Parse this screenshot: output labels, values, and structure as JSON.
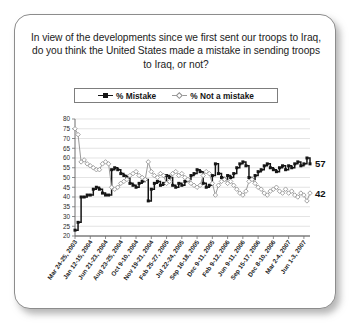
{
  "card": {
    "question": "In view of the developments since we first sent our troops to Iraq, do you think the United States made a mistake in sending troops to Iraq, or not?"
  },
  "legend": {
    "position": "top-center",
    "items": [
      {
        "label": "% Mistake",
        "marker": "filled-square",
        "color": "#151515"
      },
      {
        "label": "% Not a mistake",
        "marker": "open-diamond",
        "color": "#9a9a9a"
      }
    ]
  },
  "end_labels": {
    "mistake": "57",
    "not_a_mistake": "42"
  },
  "chart_data": {
    "type": "line",
    "title": "In view of the developments since we first sent our troops to Iraq, do you think the United States made a mistake in sending troops to Iraq, or not?",
    "xlabel": "",
    "ylabel": "",
    "ylim": [
      20,
      80
    ],
    "ytick_step": 5,
    "yticks": [
      20,
      25,
      30,
      35,
      40,
      45,
      50,
      55,
      60,
      65,
      70,
      75,
      80
    ],
    "grid": true,
    "legend_position": "top-center",
    "x_tick_labels": [
      "Mar 24-25, 2003",
      "Jan 12-15, 2004",
      "Jun 21-23, 2004",
      "Aug 23-25, 2004",
      "Oct 9-10, 2004",
      "Nov 19-21, 2004",
      "Feb 25-27, 2005",
      "Jul 22-24, 2005",
      "Sep 16-18, 2005",
      "Dec 9-11, 2005",
      "Feb 9-12, 2006",
      "Jun 9-11, 2006",
      "Sep 15-17, 2006",
      "Dec 8-10, 2006",
      "Mar 2-4, 2007",
      "Jun 1-3, 2007"
    ],
    "x_tick_indices": [
      0,
      5,
      10,
      15,
      20,
      25,
      30,
      35,
      40,
      45,
      50,
      55,
      60,
      65,
      70,
      75
    ],
    "n_points": 78,
    "series": [
      {
        "name": "% Mistake",
        "color": "#151515",
        "marker": "filled-square",
        "values": [
          23,
          27,
          40,
          40,
          41,
          41,
          44,
          45,
          44,
          42,
          41,
          41,
          54,
          55,
          54,
          52,
          51,
          50,
          47,
          46,
          45,
          47,
          48,
          49,
          38,
          44,
          47,
          48,
          46,
          47,
          51,
          50,
          46,
          45,
          47,
          46,
          48,
          49,
          51,
          52,
          54,
          53,
          47,
          45,
          46,
          51,
          57,
          52,
          50,
          49,
          51,
          50,
          52,
          55,
          57,
          58,
          56,
          50,
          49,
          51,
          53,
          54,
          56,
          57,
          55,
          54,
          53,
          55,
          56,
          54,
          56,
          55,
          57,
          58,
          56,
          57,
          60,
          57
        ]
      },
      {
        "name": "% Not a mistake",
        "color": "#9a9a9a",
        "marker": "open-diamond",
        "values": [
          75,
          72,
          58,
          59,
          57,
          56,
          55,
          54,
          54,
          57,
          58,
          57,
          45,
          44,
          45,
          47,
          48,
          49,
          51,
          52,
          53,
          51,
          50,
          49,
          58,
          53,
          51,
          50,
          52,
          51,
          47,
          48,
          52,
          53,
          51,
          52,
          50,
          49,
          47,
          46,
          45,
          46,
          51,
          53,
          52,
          47,
          41,
          46,
          48,
          49,
          47,
          48,
          46,
          44,
          42,
          41,
          43,
          48,
          49,
          47,
          45,
          44,
          42,
          41,
          43,
          44,
          45,
          43,
          42,
          44,
          42,
          43,
          41,
          40,
          42,
          41,
          38,
          42
        ]
      }
    ],
    "annotations": [
      {
        "text": "57",
        "series": "% Mistake",
        "at": "last"
      },
      {
        "text": "42",
        "series": "% Not a mistake",
        "at": "last"
      }
    ]
  }
}
